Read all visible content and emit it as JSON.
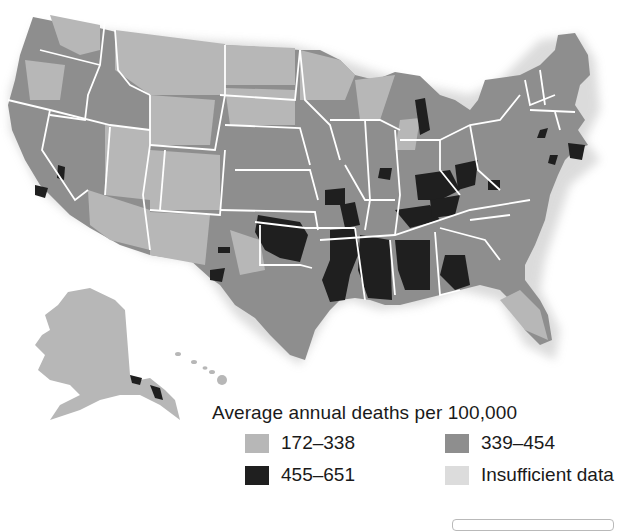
{
  "map": {
    "subject": "United States county map",
    "regions_shown": [
      "Contiguous United States",
      "Alaska",
      "Hawaii"
    ],
    "state_borders_color": "#ffffff"
  },
  "legend": {
    "title": "Average annual deaths per 100,000",
    "items": [
      {
        "label": "172–338",
        "color": "#b7b7b7",
        "icon": "light-gray-swatch"
      },
      {
        "label": "339–454",
        "color": "#8e8e8e",
        "icon": "medium-gray-swatch"
      },
      {
        "label": "455–651",
        "color": "#1f1f1f",
        "icon": "black-swatch"
      },
      {
        "label": "Insufficient data",
        "color": "#dcdcdc",
        "icon": "pale-gray-swatch"
      }
    ]
  }
}
